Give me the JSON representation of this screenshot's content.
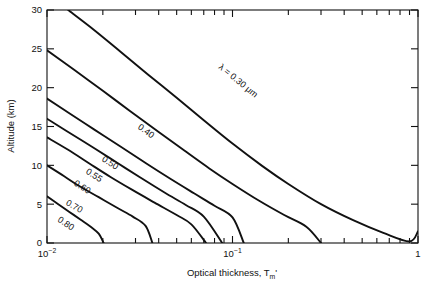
{
  "chart_data": {
    "type": "line",
    "title": "",
    "xlabel": "Optical thickness, Tₘ'",
    "ylabel": "Altitude (km)",
    "xscale": "log",
    "yscale": "linear",
    "xlim": [
      0.01,
      1
    ],
    "ylim": [
      0,
      30
    ],
    "grid": false,
    "legend": "none (inline curve labels)",
    "xticklabels": [
      "10⁻²",
      "10⁻¹",
      "1"
    ],
    "xtickvalues": [
      0.01,
      0.1,
      1
    ],
    "yticklabels": [
      "0",
      "5",
      "10",
      "15",
      "20",
      "25",
      "30"
    ],
    "ytickvalues": [
      0,
      5,
      10,
      15,
      20,
      25,
      30
    ],
    "minor_ticks": "log decades (2..9 within each decade), top and bottom axes",
    "series": [
      {
        "name": "0.30",
        "label": "λ = 0.30 μm",
        "label_x": 0.105,
        "label_y": 20.6,
        "points": [
          [
            0.013,
            30.0
          ],
          [
            0.018,
            27.4
          ],
          [
            0.025,
            24.6
          ],
          [
            0.035,
            21.7
          ],
          [
            0.05,
            18.7
          ],
          [
            0.07,
            15.8
          ],
          [
            0.1,
            12.8
          ],
          [
            0.145,
            9.9
          ],
          [
            0.2,
            7.6
          ],
          [
            0.3,
            5.0
          ],
          [
            0.45,
            2.9
          ],
          [
            0.65,
            1.3
          ],
          [
            0.9,
            0.2
          ],
          [
            1.0,
            1.5
          ]
        ]
      },
      {
        "name": "0.40",
        "label": "0.40",
        "label_x": 0.0335,
        "label_y": 14.1,
        "points": [
          [
            0.01,
            24.8
          ],
          [
            0.014,
            22.3
          ],
          [
            0.02,
            19.6
          ],
          [
            0.028,
            17.0
          ],
          [
            0.04,
            14.3
          ],
          [
            0.055,
            11.9
          ],
          [
            0.075,
            9.6
          ],
          [
            0.1,
            7.6
          ],
          [
            0.14,
            5.4
          ],
          [
            0.19,
            3.6
          ],
          [
            0.25,
            2.1
          ],
          [
            0.3,
            0.0
          ]
        ]
      },
      {
        "name": "0.50",
        "label": "0.50",
        "label_x": 0.0215,
        "label_y": 10.0,
        "points": [
          [
            0.01,
            18.6
          ],
          [
            0.013,
            16.8
          ],
          [
            0.018,
            14.6
          ],
          [
            0.025,
            12.4
          ],
          [
            0.034,
            10.3
          ],
          [
            0.046,
            8.3
          ],
          [
            0.062,
            6.4
          ],
          [
            0.08,
            4.8
          ],
          [
            0.1,
            3.3
          ],
          [
            0.115,
            0.0
          ]
        ]
      },
      {
        "name": "0.55",
        "label": "0.55",
        "label_x": 0.0176,
        "label_y": 8.4,
        "points": [
          [
            0.01,
            16.0
          ],
          [
            0.013,
            14.3
          ],
          [
            0.018,
            12.2
          ],
          [
            0.024,
            10.3
          ],
          [
            0.032,
            8.4
          ],
          [
            0.043,
            6.5
          ],
          [
            0.056,
            4.9
          ],
          [
            0.07,
            3.4
          ],
          [
            0.088,
            0.0
          ]
        ]
      },
      {
        "name": "0.60",
        "label": "0.60",
        "label_x": 0.0152,
        "label_y": 6.9,
        "points": [
          [
            0.01,
            13.6
          ],
          [
            0.013,
            12.0
          ],
          [
            0.017,
            10.2
          ],
          [
            0.022,
            8.5
          ],
          [
            0.029,
            6.8
          ],
          [
            0.038,
            5.2
          ],
          [
            0.05,
            3.6
          ],
          [
            0.06,
            2.4
          ],
          [
            0.072,
            0.0
          ]
        ]
      },
      {
        "name": "0.70",
        "label": "0.70",
        "label_x": 0.0138,
        "label_y": 4.4,
        "points": [
          [
            0.01,
            10.0
          ],
          [
            0.012,
            8.8
          ],
          [
            0.015,
            7.3
          ],
          [
            0.019,
            5.9
          ],
          [
            0.024,
            4.5
          ],
          [
            0.029,
            3.4
          ],
          [
            0.034,
            2.2
          ],
          [
            0.037,
            0.0
          ]
        ]
      },
      {
        "name": "0.80",
        "label": "0.80",
        "label_x": 0.0124,
        "label_y": 2.2,
        "points": [
          [
            0.01,
            6.0
          ],
          [
            0.0115,
            5.0
          ],
          [
            0.0132,
            4.0
          ],
          [
            0.0152,
            3.0
          ],
          [
            0.0172,
            2.1
          ],
          [
            0.019,
            1.2
          ],
          [
            0.0202,
            0.0
          ]
        ]
      }
    ]
  },
  "figure": {
    "xaxis_title": "Optical thickness, Tₘ'",
    "yaxis_title": "Altitude (km)"
  }
}
